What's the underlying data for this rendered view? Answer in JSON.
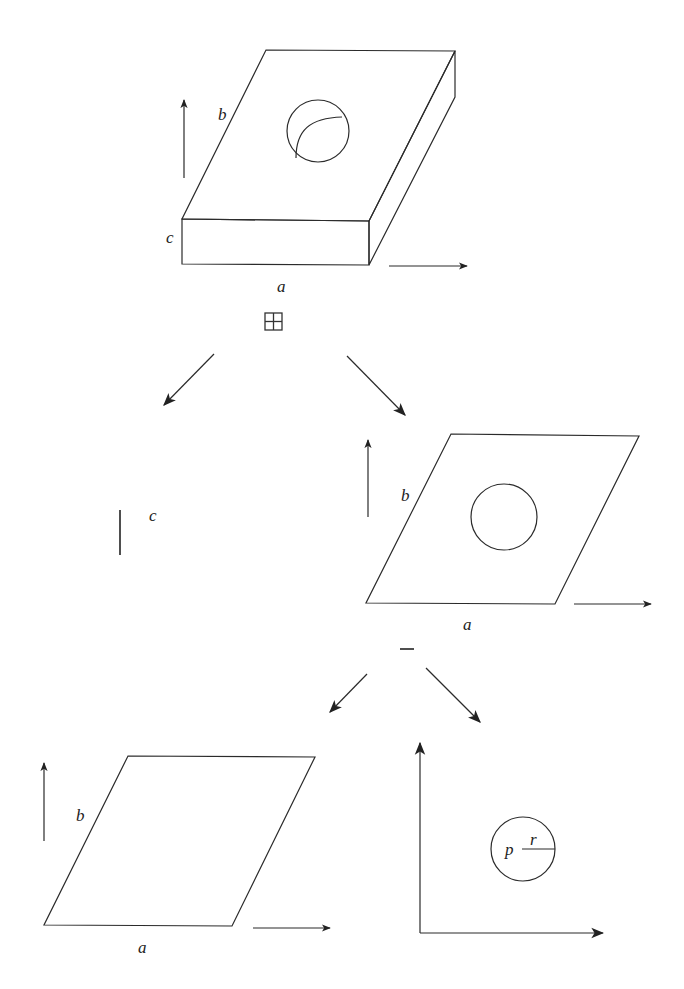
{
  "diagram": {
    "colors": {
      "line": "#2b2b2b",
      "background": "#ffffff"
    },
    "nodes": {
      "solid_plate": {
        "labels": {
          "width": "a",
          "depth": "b",
          "height": "c"
        }
      },
      "product_operator": {
        "symbol": "⊞",
        "name": "product"
      },
      "segment": {
        "labels": {
          "length": "c"
        }
      },
      "plate_with_hole": {
        "labels": {
          "width": "a",
          "depth": "b"
        }
      },
      "difference_operator": {
        "symbol": "−",
        "name": "difference"
      },
      "parallelogram": {
        "labels": {
          "width": "a",
          "depth": "b"
        }
      },
      "disk": {
        "labels": {
          "center": "p",
          "radius": "r"
        }
      }
    },
    "edges": [
      {
        "from": "product_operator",
        "to": "segment"
      },
      {
        "from": "product_operator",
        "to": "plate_with_hole"
      },
      {
        "from": "difference_operator",
        "to": "parallelogram"
      },
      {
        "from": "difference_operator",
        "to": "disk"
      }
    ]
  }
}
